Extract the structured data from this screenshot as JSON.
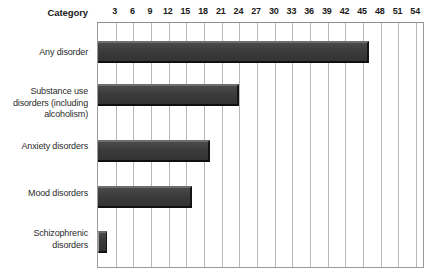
{
  "chart_data": {
    "type": "bar",
    "orientation": "horizontal",
    "title": "",
    "xlabel": "",
    "ylabel": "Category",
    "categories": [
      "Any disorder",
      "Substance use disorders (including alcoholism)",
      "Anxiety disorders",
      "Mood disorders",
      "Schizophrenic disorders"
    ],
    "values": [
      46,
      24,
      19,
      16,
      1.5
    ],
    "xlim": [
      0,
      55.5
    ],
    "xticks": [
      3,
      6,
      9,
      12,
      15,
      18,
      21,
      24,
      27,
      30,
      33,
      36,
      39,
      42,
      45,
      48,
      51,
      54
    ],
    "grid": true,
    "legend": false
  },
  "axis": {
    "header_label": "Category",
    "tick_labels": [
      "3",
      "6",
      "9",
      "12",
      "15",
      "18",
      "21",
      "24",
      "27",
      "30",
      "33",
      "36",
      "39",
      "42",
      "45",
      "48",
      "51",
      "54"
    ]
  },
  "bars": [
    {
      "label": "Any disorder",
      "label_lines": [
        "Any disorder"
      ],
      "value": 46
    },
    {
      "label": "Substance use disorders (including alcoholism)",
      "label_lines": [
        "Substance use",
        "disorders (including",
        "alcoholism)"
      ],
      "value": 24
    },
    {
      "label": "Anxiety disorders",
      "label_lines": [
        "Anxiety disorders"
      ],
      "value": 19
    },
    {
      "label": "Mood disorders",
      "label_lines": [
        "Mood disorders"
      ],
      "value": 16
    },
    {
      "label": "Schizophrenic disorders",
      "label_lines": [
        "Schizophrenic",
        "disorders"
      ],
      "value": 1.5
    }
  ],
  "colors": {
    "bar_fill": "#3c3c3c",
    "bar_top_highlight": "#6e6e6e",
    "bar_shadow": "#101010",
    "gridline": "#b8b8b8",
    "plot_border": "#9a9a9a",
    "text": "#2b2b2b",
    "background": "#ffffff"
  }
}
